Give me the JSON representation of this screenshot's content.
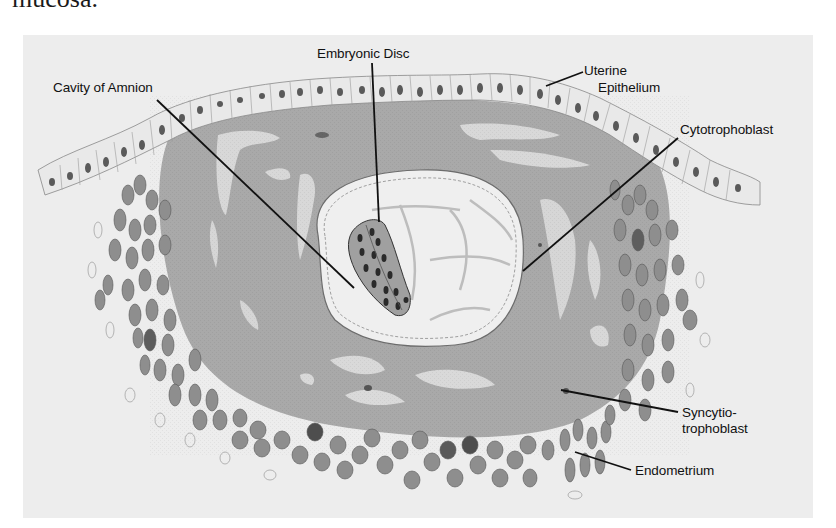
{
  "page": {
    "cut_text": "mucosa."
  },
  "figure": {
    "labels": {
      "embryonic_disc": "Embryonic Disc",
      "cavity_of_amnion": "Cavity of Amnion",
      "uterine_line1": "Uterine",
      "uterine_line2": "Epithelium",
      "cytotrophoblast": "Cytotrophoblast",
      "syncytio_line1": "Syncytio-",
      "syncytio_line2": "trophoblast",
      "endometrium": "Endometrium"
    },
    "colors": {
      "panel_background": "#ededed",
      "syncytiotrophoblast_fill": "#a8a8a8",
      "lacunae_fill": "#d9d9d9",
      "amnion_cavity_fill": "#efefef",
      "endometrial_cell_fill": "#8c8c8c",
      "nucleus_fill": "#3a3a3a",
      "leader_line": "#111111"
    }
  }
}
